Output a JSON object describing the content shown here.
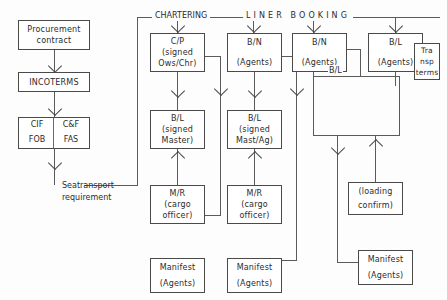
{
  "diagram": {
    "headers": {
      "chartering": "CHARTERING",
      "liner_booking": "LINER BOOKING"
    },
    "left_column": {
      "procurement": {
        "line1": "Procurement",
        "line2": "contract"
      },
      "incoterms": {
        "line1": "INCOTERMS"
      },
      "incoterms_grid": {
        "cif": "CIF",
        "cnf": "C&F",
        "fob": "FOB",
        "fas": "FAS"
      },
      "seatransport": {
        "line1": "Seatransport",
        "line2": "requirement"
      }
    },
    "col_chartering": {
      "cp": {
        "line1": "C/P",
        "line2": "(signed",
        "line3": "Ows/Chr)"
      },
      "bl": {
        "line1": "B/L",
        "line2": "(signed",
        "line3": "Master)"
      },
      "mr": {
        "line1": "M/R",
        "line2": "(cargo",
        "line3": "officer)"
      },
      "manifest": {
        "line1": "Manifest",
        "line2": "(Agents)"
      }
    },
    "col_booking_1": {
      "bn": {
        "line1": "B/N",
        "line2": "(Agents)"
      },
      "bl": {
        "line1": "B/L",
        "line2": "(signed",
        "line3": "Mast/Ag)"
      },
      "mr": {
        "line1": "M/R",
        "line2": "(cargo",
        "line3": "officer)"
      },
      "manifest": {
        "line1": "Manifest",
        "line2": "(Agents)"
      }
    },
    "col_booking_2": {
      "bn": {
        "line1": "B/N",
        "line2": "(Agents)"
      },
      "bl_label": "B/L",
      "loading": {
        "line1": "(loading",
        "line2": "confirm)"
      },
      "manifest": {
        "line1": "Manifest",
        "line2": "(Agents)"
      }
    },
    "col_booking_3": {
      "bl": {
        "line1": "B/L",
        "line2": "(Agents)"
      },
      "transp": {
        "line1": "Tra",
        "line2": "nsp",
        "line3": "terms"
      }
    },
    "colors": {
      "ink": "#2b2b2b",
      "stroke": "#4a4a4a",
      "paper": "#fdfdfd"
    }
  }
}
